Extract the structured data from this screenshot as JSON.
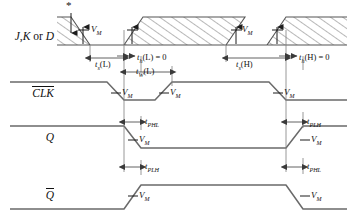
{
  "figure": {
    "type": "timing-diagram",
    "title_note": "*",
    "background": "#ffffff",
    "line_color": "#5a5a5a",
    "text_color": "#111111"
  },
  "rows": [
    {
      "id": "data",
      "label_plain": "J,K or D",
      "label_parts": [
        {
          "text": "J",
          "style": "italic"
        },
        {
          "text": ",",
          "style": "roman"
        },
        {
          "text": "K",
          "style": "italic"
        },
        {
          "text": " or ",
          "style": "roman"
        },
        {
          "text": "D",
          "style": "italic"
        }
      ],
      "overline": false,
      "waveform": "data-valid-hatched"
    },
    {
      "id": "clk",
      "label_plain": "CLK",
      "overline": true,
      "waveform": "high-low-high-low"
    },
    {
      "id": "q",
      "label_plain": "Q",
      "overline": false,
      "waveform": "high-low-high"
    },
    {
      "id": "qbar",
      "label_plain": "Q",
      "overline": true,
      "waveform": "low-high-low"
    }
  ],
  "vm_labels": [
    {
      "text": "V",
      "sub": "M",
      "row": "data",
      "edge": "fall-1"
    },
    {
      "text": "V",
      "sub": "M",
      "row": "data",
      "edge": "rise-1"
    },
    {
      "text": "V",
      "sub": "M",
      "row": "data",
      "edge": "fall-2"
    },
    {
      "text": "V",
      "sub": "M",
      "row": "data",
      "edge": "rise-2"
    },
    {
      "text": "V",
      "sub": "M",
      "row": "clk",
      "edge": "fall-1"
    },
    {
      "text": "V",
      "sub": "M",
      "row": "clk",
      "edge": "rise-1"
    },
    {
      "text": "V",
      "sub": "M",
      "row": "clk",
      "edge": "fall-2"
    },
    {
      "text": "V",
      "sub": "M",
      "row": "q",
      "edge": "fall-1"
    },
    {
      "text": "V",
      "sub": "M",
      "row": "q",
      "edge": "rise-1"
    },
    {
      "text": "V",
      "sub": "M",
      "row": "qbar",
      "edge": "rise-1"
    },
    {
      "text": "V",
      "sub": "M",
      "row": "qbar",
      "edge": "fall-1"
    }
  ],
  "timing_params": [
    {
      "id": "ts-low",
      "base": "t",
      "sub": "s",
      "arg": "(L)",
      "value": "",
      "full": "t_s(L)",
      "between": "data-fall-edge to clk-fall-edge"
    },
    {
      "id": "th-low",
      "base": "t",
      "sub": "h",
      "arg": "(L)",
      "value": " = 0",
      "full": "t_h(L) = 0",
      "between": "clk-fall-edge to data-rise-edge"
    },
    {
      "id": "tw-low",
      "base": "t",
      "sub": "W",
      "arg": "(L)",
      "value": "",
      "full": "t_W(L)",
      "between": "clk-fall-edge to clk-rise-edge"
    },
    {
      "id": "ts-high",
      "base": "t",
      "sub": "s",
      "arg": "(H)",
      "value": "",
      "full": "t_s(H)",
      "between": "data-fall-edge-2 to clk-fall-edge-2"
    },
    {
      "id": "th-high",
      "base": "t",
      "sub": "h",
      "arg": "(H)",
      "value": " = 0",
      "full": "t_h(H) = 0",
      "between": "clk-fall-edge-2 to data-rise-edge-2"
    },
    {
      "id": "tphl-q",
      "base": "t",
      "sub": "PHL",
      "arg": "",
      "value": "",
      "full": "t_PHL",
      "between": "clk-fall-edge to q-fall-edge"
    },
    {
      "id": "tplh-q",
      "base": "t",
      "sub": "PLH",
      "arg": "",
      "value": "",
      "full": "t_PLH",
      "between": "clk-fall-edge-2 to q-rise-edge"
    },
    {
      "id": "tplh-qbar",
      "base": "t",
      "sub": "PLH",
      "arg": "",
      "value": "",
      "full": "t_PLH",
      "between": "clk-fall-edge to qbar-rise-edge"
    },
    {
      "id": "tphl-qbar",
      "base": "t",
      "sub": "PHL",
      "arg": "",
      "value": "",
      "full": "t_PHL",
      "between": "clk-fall-edge-2 to qbar-fall-edge"
    }
  ]
}
